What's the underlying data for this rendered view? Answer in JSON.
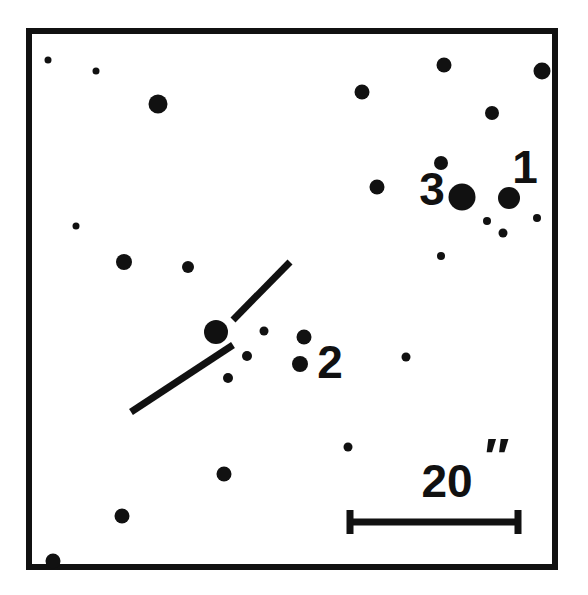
{
  "figure": {
    "kind": "astronomical-finder-chart",
    "background_color": "#ffffff",
    "ink_color": "#111111",
    "frame": {
      "x": 26,
      "y": 28,
      "width": 532,
      "height": 542,
      "stroke_width": 6
    }
  },
  "chart_data": {
    "type": "scatter",
    "title": "",
    "subtitle": "",
    "xlabel": "",
    "ylabel": "",
    "grid": false,
    "legend_position": "none",
    "xlim": [
      26,
      558
    ],
    "ylim": [
      28,
      570
    ],
    "annotations": [
      {
        "text": "1",
        "x": 525,
        "y": 183
      },
      {
        "text": "3",
        "x": 432,
        "y": 205
      },
      {
        "text": "2",
        "x": 330,
        "y": 378
      },
      {
        "text": "20",
        "x": 447,
        "y": 497
      },
      {
        "text": "″",
        "x": 497,
        "y": 475
      }
    ],
    "scale_bar": {
      "label": "20",
      "unit": "″",
      "x_start": 350,
      "x_end": 518,
      "y": 522,
      "bar_thickness": 7,
      "cap_half_height": 12
    },
    "marker_line": {
      "description": "broken diagonal pointer through target star",
      "segment_a": {
        "x1": 233,
        "y1": 345,
        "x2": 131,
        "y2": 412
      },
      "segment_b": {
        "x1": 233,
        "y1": 320,
        "x2": 290,
        "y2": 262
      },
      "thickness": 7
    },
    "points": [
      {
        "id": "s01",
        "x": 48,
        "y": 60,
        "r": 3.5
      },
      {
        "id": "s02",
        "x": 96,
        "y": 71,
        "r": 3.5
      },
      {
        "id": "s03",
        "x": 158,
        "y": 104,
        "r": 9.5
      },
      {
        "id": "s04",
        "x": 362,
        "y": 92,
        "r": 7.5
      },
      {
        "id": "s05",
        "x": 444,
        "y": 65,
        "r": 7.5
      },
      {
        "id": "s06",
        "x": 542,
        "y": 71,
        "r": 8.5
      },
      {
        "id": "s07",
        "x": 492,
        "y": 113,
        "r": 7.0
      },
      {
        "id": "s08",
        "x": 441,
        "y": 163,
        "r": 7.0
      },
      {
        "id": "s09",
        "x": 377,
        "y": 187,
        "r": 7.5
      },
      {
        "id": "s10",
        "x": 462,
        "y": 197,
        "r": 13.5,
        "label": "3"
      },
      {
        "id": "s11",
        "x": 509,
        "y": 198,
        "r": 11.0,
        "label": "1"
      },
      {
        "id": "s12",
        "x": 487,
        "y": 221,
        "r": 4.0
      },
      {
        "id": "s13",
        "x": 503,
        "y": 233,
        "r": 4.5
      },
      {
        "id": "s14",
        "x": 537,
        "y": 218,
        "r": 4.0
      },
      {
        "id": "s15",
        "x": 441,
        "y": 256,
        "r": 4.0
      },
      {
        "id": "s16",
        "x": 76,
        "y": 226,
        "r": 3.5
      },
      {
        "id": "s17",
        "x": 124,
        "y": 262,
        "r": 8.0
      },
      {
        "id": "s18",
        "x": 188,
        "y": 267,
        "r": 6.0
      },
      {
        "id": "s19",
        "x": 216,
        "y": 332,
        "r": 12.0,
        "target": true
      },
      {
        "id": "s20",
        "x": 264,
        "y": 331,
        "r": 4.5
      },
      {
        "id": "s21",
        "x": 247,
        "y": 356,
        "r": 5.0
      },
      {
        "id": "s22",
        "x": 228,
        "y": 378,
        "r": 5.0
      },
      {
        "id": "s23",
        "x": 304,
        "y": 337,
        "r": 7.5
      },
      {
        "id": "s24",
        "x": 300,
        "y": 364,
        "r": 8.0,
        "label": "2"
      },
      {
        "id": "s25",
        "x": 406,
        "y": 357,
        "r": 4.5
      },
      {
        "id": "s26",
        "x": 348,
        "y": 447,
        "r": 4.5
      },
      {
        "id": "s27",
        "x": 224,
        "y": 474,
        "r": 7.5
      },
      {
        "id": "s28",
        "x": 122,
        "y": 516,
        "r": 7.5
      },
      {
        "id": "s29",
        "x": 53,
        "y": 561,
        "r": 7.5
      }
    ]
  }
}
